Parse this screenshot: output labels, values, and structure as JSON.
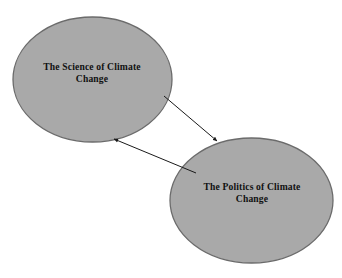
{
  "diagram": {
    "type": "node-link-diagram",
    "background_color": "#ffffff",
    "width": 342,
    "height": 278,
    "node_fill_color": "#a9a9a9",
    "node_stroke_color": "#6b6b6b",
    "edge_color": "#1a1a1a",
    "text_color": "#111111",
    "nodes": [
      {
        "id": "science",
        "shape": "ellipse",
        "label": "The Science of Climate\nChange",
        "label_line_1": "The Science of Climate",
        "label_line_2": "Change",
        "cx": 92.5,
        "cy": 79.5,
        "rx": 79.5,
        "ry": 62.5
      },
      {
        "id": "politics",
        "shape": "ellipse",
        "label": "The Politics of Climate\nChange",
        "label_line_1": "The Politics of Climate",
        "label_line_2": "Change",
        "cx": 251.5,
        "cy": 200.5,
        "rx": 81.5,
        "ry": 62.5
      }
    ],
    "edges": [
      {
        "id": "science-to-politics",
        "from": "science",
        "to": "politics",
        "direction": "one-way",
        "arrowhead": "filled-triangle",
        "x1": 164,
        "y1": 96,
        "x2": 217,
        "y2": 141
      },
      {
        "id": "politics-to-science",
        "from": "politics",
        "to": "science",
        "direction": "one-way",
        "arrowhead": "filled-triangle",
        "x1": 196,
        "y1": 173,
        "x2": 114,
        "y2": 139
      }
    ]
  }
}
